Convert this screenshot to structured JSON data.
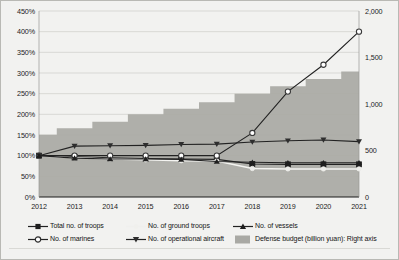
{
  "chart_data": {
    "type": "line",
    "title": "",
    "xlabel": "",
    "ylabel": "",
    "grid": true,
    "legend_position": "bottom",
    "x": [
      2012,
      2013,
      2014,
      2015,
      2016,
      2017,
      2018,
      2019,
      2020,
      2021
    ],
    "left_axis": {
      "label": "",
      "ylim": [
        0,
        450
      ],
      "ticks": [
        0,
        50,
        100,
        150,
        200,
        250,
        300,
        350,
        400,
        450
      ],
      "tick_labels": [
        "0%",
        "50%",
        "100%",
        "150%",
        "200%",
        "250%",
        "300%",
        "350%",
        "400%",
        "450%"
      ]
    },
    "right_axis": {
      "label": "Defense budget (billion yuan)",
      "ylim": [
        0,
        2000
      ],
      "ticks": [
        0,
        500,
        1000,
        1500,
        2000
      ],
      "tick_labels": [
        "0",
        "500",
        "1,000",
        "1,500",
        "2,000"
      ]
    },
    "series": [
      {
        "name": "Total no. of troops",
        "marker": "filled-square",
        "color": "#2b2b2b",
        "axis": "left",
        "values": [
          100,
          97,
          95,
          93,
          92,
          91,
          80,
          79,
          79,
          79
        ]
      },
      {
        "name": "No. of ground troops",
        "marker": "light-circle",
        "color": "#f2f2f0",
        "axis": "left",
        "values": [
          100,
          95,
          92,
          90,
          88,
          87,
          69,
          68,
          68,
          68
        ]
      },
      {
        "name": "No. of marines",
        "marker": "open-circle",
        "color": "#5a5a5a",
        "axis": "left",
        "values": [
          100,
          100,
          100,
          100,
          100,
          100,
          155,
          255,
          320,
          400
        ]
      },
      {
        "name": "No. of operational aircraft",
        "marker": "inverted-triangle",
        "color": "#3a3a3a",
        "axis": "left",
        "values": [
          100,
          123,
          124,
          125,
          127,
          128,
          133,
          136,
          138,
          134
        ]
      },
      {
        "name": "No. of vessels",
        "marker": "filled-triangle",
        "color": "#2b2b2b",
        "axis": "left",
        "values": [
          100,
          94,
          92,
          92,
          91,
          86,
          84,
          83,
          83,
          83
        ]
      }
    ],
    "area_series": {
      "name": "Defense budget (billion yuan): Right axis",
      "type": "step-area",
      "color": "#a9a9a4",
      "axis": "right",
      "values": [
        670,
        740,
        810,
        890,
        950,
        1020,
        1110,
        1190,
        1270,
        1350
      ]
    }
  },
  "legend": {
    "items": [
      {
        "label": "Total no. of troops",
        "marker": "filled-square"
      },
      {
        "label": "No. of ground troops",
        "marker": "light-circle"
      },
      {
        "label": "No. of marines",
        "marker": "open-circle"
      },
      {
        "label": "No. of operational aircraft",
        "marker": "inverted-triangle"
      },
      {
        "label": "No. of vessels",
        "marker": "filled-triangle"
      },
      {
        "label": "Defense budget (billion yuan): Right axis",
        "marker": "area-swatch"
      }
    ]
  }
}
